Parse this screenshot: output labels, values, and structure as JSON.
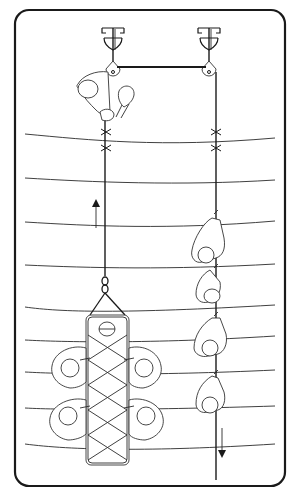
{
  "diagram": {
    "frame": {
      "x": 15,
      "y": 10,
      "width": 270,
      "height": 476,
      "radius": 14,
      "stroke": "#1a1a1a"
    },
    "anchors": [
      {
        "name": "left-anchor",
        "x": 113,
        "y": 32
      },
      {
        "name": "right-anchor",
        "x": 209,
        "y": 32
      }
    ],
    "pulleys": [
      {
        "name": "left-pulley",
        "x": 113,
        "y": 71
      },
      {
        "name": "right-pulley",
        "x": 209,
        "y": 71
      }
    ],
    "ropes": {
      "left_x": 105,
      "right_x": 216,
      "top_y": 67,
      "left_bottom_y": 276,
      "right_bottom_y": 480
    },
    "knots": [
      {
        "x": 106,
        "y": 132
      },
      {
        "x": 106,
        "y": 148
      },
      {
        "x": 216,
        "y": 132
      },
      {
        "x": 216,
        "y": 148
      }
    ],
    "contour_lines_y": [
      134,
      178,
      222,
      265,
      307,
      340,
      372,
      408,
      444
    ],
    "arrows": [
      {
        "name": "up-arrow",
        "direction": "up",
        "x": 96,
        "y1": 228,
        "y2": 203
      },
      {
        "name": "down-arrow",
        "direction": "down",
        "x": 222,
        "y1": 428,
        "y2": 456
      }
    ],
    "stretcher": {
      "x": 86,
      "y": 315,
      "width": 43,
      "height": 150
    },
    "hauler_figures": [
      {
        "x": 216,
        "y": 235
      },
      {
        "x": 216,
        "y": 285
      },
      {
        "x": 216,
        "y": 340
      },
      {
        "x": 216,
        "y": 390
      }
    ],
    "colors": {
      "ink": "#1a1a1a",
      "background": "#ffffff"
    }
  }
}
